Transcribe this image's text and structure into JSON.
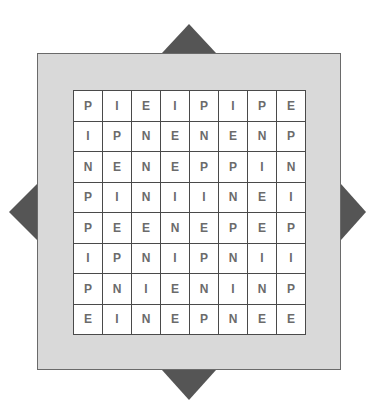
{
  "puzzle": {
    "type": "letter-grid",
    "rows": 8,
    "cols": 8,
    "grid": [
      [
        "P",
        "I",
        "E",
        "I",
        "P",
        "I",
        "P",
        "E"
      ],
      [
        "I",
        "P",
        "N",
        "E",
        "N",
        "E",
        "N",
        "P"
      ],
      [
        "N",
        "E",
        "N",
        "E",
        "P",
        "P",
        "I",
        "N"
      ],
      [
        "P",
        "I",
        "N",
        "I",
        "I",
        "N",
        "E",
        "I"
      ],
      [
        "P",
        "E",
        "E",
        "N",
        "E",
        "P",
        "E",
        "P"
      ],
      [
        "I",
        "P",
        "N",
        "I",
        "P",
        "N",
        "I",
        "I"
      ],
      [
        "P",
        "N",
        "I",
        "E",
        "N",
        "I",
        "N",
        "P"
      ],
      [
        "E",
        "I",
        "N",
        "E",
        "P",
        "N",
        "E",
        "E"
      ]
    ]
  },
  "colors": {
    "frame": "#d9d9d9",
    "pointer": "#555555",
    "cell_border": "#4a4a4a",
    "letter": "#6b6b6b"
  }
}
